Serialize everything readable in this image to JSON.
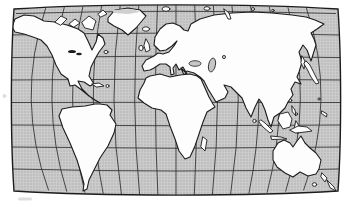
{
  "colors": {
    "page_background": "#ffffff",
    "ocean_base": "#cbcbcb",
    "ocean_dot": "#a9a9a9",
    "lake_fill": "#c6c6c6",
    "coastline": "#1c1c1c",
    "graticule": "#2e2e2e",
    "land": "#fdfdfd",
    "icecap_shading": "#cfcfcf",
    "page_speck": "#dedede"
  },
  "map": {
    "kind": "black-and-white world map line art on halftone gray ocean",
    "projection_style": "rounded oval pseudocylindrical with curved graticule",
    "graticule": {
      "parallels": 8,
      "meridians": 15
    },
    "landmasses": [
      "North America",
      "South America",
      "Greenland",
      "Eurasia",
      "Africa",
      "Australia"
    ],
    "islands": [
      "Canadian Arctic Islands",
      "Ellesmere Island",
      "Baffin Island",
      "Newfoundland",
      "Cuba",
      "Hispaniola",
      "Iceland",
      "Great Britain",
      "Ireland",
      "Svalbard",
      "Novaya Zemlya",
      "Sakhalin",
      "Japan",
      "Taiwan",
      "Philippines",
      "Sri Lanka",
      "Sumatra",
      "Java",
      "Borneo",
      "Sulawesi",
      "New Guinea",
      "Madagascar",
      "Tasmania",
      "New Zealand"
    ],
    "water_features": [
      "Hudson Bay",
      "Mediterranean Sea",
      "Baltic Sea",
      "Black Sea",
      "Caspian Sea",
      "Red Sea",
      "Persian Gulf",
      "Great Lakes"
    ]
  }
}
